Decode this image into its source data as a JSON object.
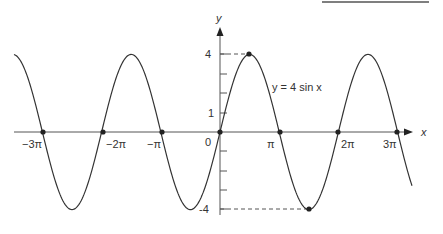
{
  "chart_data": {
    "type": "line",
    "title": "",
    "function_label": "y = 4 sin x",
    "xlabel": "x",
    "ylabel": "y",
    "x_tick_labels": [
      "-3π",
      "-2π",
      "-π",
      "0",
      "π",
      "2π",
      "3π"
    ],
    "x_tick_values": [
      -9.4248,
      -6.2832,
      -3.1416,
      0,
      3.1416,
      6.2832,
      9.4248
    ],
    "y_tick_labels": [
      "4",
      "1",
      "-4"
    ],
    "y_tick_values": [
      4,
      1,
      -4
    ],
    "y_ticks_minor": [
      -3,
      -2,
      -1,
      2,
      3
    ],
    "amplitude": 4,
    "xlim": [
      -3.5,
      3.55
    ],
    "ylim": [
      -4.4,
      5.2
    ],
    "marked_points": [
      {
        "x": "π/2",
        "y": 4,
        "label": "max"
      },
      {
        "x": "3π/2",
        "y": -4,
        "label": "min"
      }
    ],
    "zeros": [
      "-3π",
      "-2π",
      "-π",
      "0",
      "π",
      "2π",
      "3π"
    ],
    "grid": false,
    "legend": "none"
  },
  "labels": {
    "x_axis": "x",
    "y_axis": "y",
    "equation": "y = 4 sin x",
    "origin": "0",
    "y4": "4",
    "y1": "1",
    "yneg4": "-4",
    "xm3pi": "−3π",
    "xm2pi": "−2π",
    "xmpi": "−π",
    "xpi": "π",
    "x2pi": "2π",
    "x3pi": "3π"
  }
}
